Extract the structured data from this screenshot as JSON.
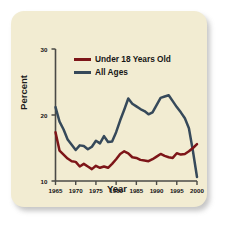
{
  "card": {
    "background_color": "#f2ecd2",
    "page_background": "#ffffff"
  },
  "chart_data": {
    "type": "line",
    "title": "",
    "xlabel": "Year",
    "ylabel": "Percent",
    "xlim": [
      1965,
      2000
    ],
    "ylim": [
      10,
      30
    ],
    "grid": false,
    "legend_position": "top-center",
    "xticks": [
      1965,
      1970,
      1975,
      1980,
      1985,
      1990,
      1995,
      2000
    ],
    "xtick_labels": [
      "1965",
      "1970",
      "1975",
      "1980",
      "1985",
      "1990",
      "1995",
      "2000"
    ],
    "yticks": [
      10,
      20,
      30
    ],
    "ytick_labels": [
      "10",
      "20",
      "30"
    ],
    "x": [
      1965,
      1966,
      1967,
      1968,
      1969,
      1970,
      1971,
      1972,
      1973,
      1974,
      1975,
      1976,
      1977,
      1978,
      1979,
      1980,
      1981,
      1982,
      1983,
      1984,
      1985,
      1986,
      1987,
      1988,
      1989,
      1990,
      1991,
      1992,
      1993,
      1994,
      1995,
      1996,
      1997,
      1998,
      1999,
      2000
    ],
    "series": [
      {
        "name": "Under 18 Years Old",
        "color": "#7d1518",
        "values": [
          17.4,
          14.6,
          14.0,
          13.4,
          13.0,
          12.9,
          12.2,
          12.6,
          12.2,
          11.8,
          12.3,
          12.0,
          12.2,
          12.0,
          12.6,
          13.3,
          14.1,
          14.5,
          14.2,
          13.6,
          13.5,
          13.2,
          13.1,
          13.0,
          13.3,
          13.7,
          14.1,
          13.8,
          13.6,
          13.5,
          14.2,
          14.0,
          14.1,
          14.5,
          15.0,
          15.6
        ]
      },
      {
        "name": "All Ages",
        "color": "#36495a",
        "values": [
          21.2,
          19.0,
          17.8,
          16.3,
          15.5,
          14.7,
          15.4,
          15.3,
          14.8,
          15.2,
          16.1,
          15.7,
          16.8,
          15.9,
          16.0,
          17.4,
          19.2,
          20.8,
          22.5,
          21.7,
          21.3,
          20.9,
          20.6,
          20.1,
          20.4,
          21.5,
          22.6,
          22.8,
          23.0,
          22.1,
          21.2,
          20.4,
          19.5,
          18.0,
          14.5,
          10.6
        ]
      }
    ],
    "legend": [
      {
        "label": "Under 18 Years Old",
        "color": "#7d1518"
      },
      {
        "label": "All Ages",
        "color": "#36495a"
      }
    ]
  }
}
